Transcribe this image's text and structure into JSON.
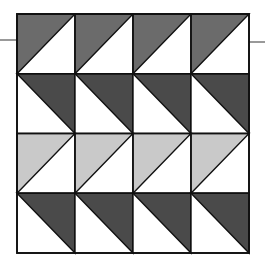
{
  "diagram": {
    "type": "quilt-block",
    "grid": {
      "rows": 4,
      "cols": 4
    },
    "origin": {
      "x": 17,
      "y": 14
    },
    "cell": {
      "w": 58,
      "h": 59.75
    },
    "colors": {
      "medium": "#6b6b6b",
      "dark": "#4a4a4a",
      "light": "#c9c9c9",
      "background": "#ffffff",
      "stroke": "#111111"
    },
    "rows": [
      {
        "shape": "upper-left",
        "fill": "medium"
      },
      {
        "shape": "upper-right",
        "fill": "dark"
      },
      {
        "shape": "upper-left",
        "fill": "light"
      },
      {
        "shape": "upper-right",
        "fill": "dark"
      }
    ],
    "ticks": [
      {
        "side": "left",
        "x1": 0,
        "x2": 17,
        "y": 40
      },
      {
        "side": "right",
        "x1": 249,
        "x2": 265,
        "y": 42
      }
    ]
  }
}
